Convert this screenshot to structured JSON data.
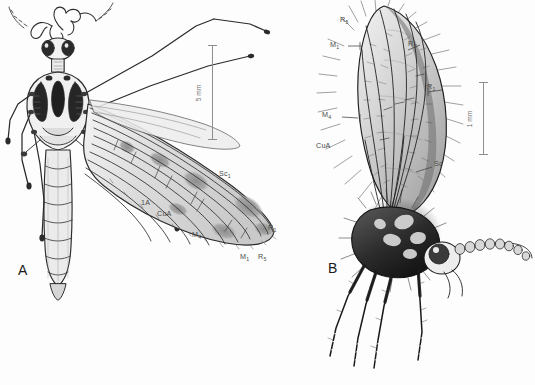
{
  "figure": {
    "background_color": "#fdfdfd",
    "ink_color": "#2b2b2b",
    "label_color": "#4a4a4a",
    "scalebar_color": "#8e8e8e",
    "caption_note": "Two-panel scientific line-drawing plate of nematoceran Diptera"
  },
  "panels": [
    {
      "id": "a",
      "letter": "A",
      "subject": "crane-fly-dorsal-habitus",
      "view": "dorsal",
      "scalebar": {
        "label": "5 mm",
        "value": 5,
        "unit": "mm",
        "orientation": "vertical"
      },
      "vein_labels": [
        {
          "id": "sc1",
          "text": "Sc",
          "sub": "1",
          "x": 219,
          "y": 169
        },
        {
          "id": "a1",
          "text": "1A",
          "sub": "",
          "x": 141,
          "y": 198
        },
        {
          "id": "cua",
          "text": "CuA",
          "sub": "",
          "x": 157,
          "y": 209
        },
        {
          "id": "m4",
          "text": "M",
          "sub": "4",
          "x": 192,
          "y": 230
        },
        {
          "id": "m1",
          "text": "M",
          "sub": "1",
          "x": 240,
          "y": 252
        },
        {
          "id": "r5",
          "text": "R",
          "sub": "5",
          "x": 258,
          "y": 252
        },
        {
          "id": "r1",
          "text": "R",
          "sub": "1",
          "x": 268,
          "y": 223
        }
      ]
    },
    {
      "id": "b",
      "letter": "B",
      "subject": "hairy-winter-crane-fly-lateral-habitus",
      "view": "lateral",
      "scalebar": {
        "label": "1 mm",
        "value": 1,
        "unit": "mm",
        "orientation": "vertical"
      },
      "vein_labels": [
        {
          "id": "r5",
          "text": "R",
          "sub": "5",
          "x": 340,
          "y": 15
        },
        {
          "id": "m1",
          "text": "M",
          "sub": "1",
          "x": 330,
          "y": 40
        },
        {
          "id": "r3",
          "text": "R",
          "sub": "3",
          "x": 408,
          "y": 39
        },
        {
          "id": "r1",
          "text": "R",
          "sub": "1",
          "x": 427,
          "y": 82
        },
        {
          "id": "m4",
          "text": "M",
          "sub": "4",
          "x": 322,
          "y": 110
        },
        {
          "id": "cua",
          "text": "CuA",
          "sub": "",
          "x": 316,
          "y": 141
        },
        {
          "id": "sc",
          "text": "Sc",
          "sub": "",
          "x": 434,
          "y": 159
        }
      ]
    }
  ]
}
